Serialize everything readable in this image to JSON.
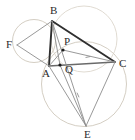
{
  "figure": {
    "width": 135,
    "height": 140,
    "background_color": "#ffffff"
  },
  "colors": {
    "heavy_stroke": "#2f2f2f",
    "medium_stroke": "#6a6a6a",
    "light_stroke": "#8d8d8d",
    "circle_stroke": "#c9c2b4",
    "circle_stroke_faint": "#d8d2c6",
    "label_color": "#2b2b2b",
    "dot_fill": "#1c1c1c"
  },
  "points": [
    {
      "name": "B",
      "label": "B",
      "x": 52,
      "y": 21,
      "label_x": 50,
      "label_y": 14,
      "dot": false
    },
    {
      "name": "F",
      "label": "F",
      "x": 17,
      "y": 45,
      "label_x": 6,
      "label_y": 48,
      "dot": false
    },
    {
      "name": "A",
      "label": "A",
      "x": 49,
      "y": 66,
      "label_x": 42,
      "label_y": 77,
      "dot": false
    },
    {
      "name": "C",
      "label": "C",
      "x": 115,
      "y": 62,
      "label_x": 119,
      "label_y": 67,
      "dot": false
    },
    {
      "name": "P",
      "label": "P",
      "x": 63,
      "y": 50,
      "label_x": 64,
      "label_y": 45,
      "dot": true
    },
    {
      "name": "Q",
      "label": "Q",
      "x": 60,
      "y": 65,
      "label_x": 65,
      "label_y": 73,
      "dot": true
    },
    {
      "name": "E",
      "label": "E",
      "x": 86,
      "y": 126,
      "label_x": 84,
      "label_y": 138,
      "dot": false
    }
  ],
  "circles": [
    {
      "name": "circumcircle-ABF",
      "cx": 34,
      "cy": 41,
      "r": 21.5,
      "stroke": "#c9c2b4",
      "width": 0.8
    },
    {
      "name": "circumcircle-ACE",
      "cx": 84,
      "cy": 84,
      "r": 42.5,
      "stroke": "#c9c2b4",
      "width": 0.8
    },
    {
      "name": "circumcircle-BPC",
      "cx": 84,
      "cy": 39,
      "r": 33.0,
      "stroke": "#d8d2c6",
      "width": 0.8
    }
  ],
  "segments": [
    {
      "name": "segment-BC",
      "from": "B",
      "to": "C",
      "stroke": "#2f2f2f",
      "width": 1.9
    },
    {
      "name": "segment-BA",
      "from": "B",
      "to": "A",
      "stroke": "#2f2f2f",
      "width": 1.9
    },
    {
      "name": "segment-AC",
      "from": "A",
      "to": "C",
      "stroke": "#6a6a6a",
      "width": 1.5
    },
    {
      "name": "segment-FB",
      "from": "F",
      "to": "B",
      "stroke": "#8d8d8d",
      "width": 0.9
    },
    {
      "name": "segment-FA",
      "from": "F",
      "to": "A",
      "stroke": "#8d8d8d",
      "width": 0.9
    },
    {
      "name": "segment-AP",
      "from": "A",
      "to": "P",
      "stroke": "#8d8d8d",
      "width": 0.9
    },
    {
      "name": "segment-PC",
      "from": "P",
      "to": "C",
      "stroke": "#8d8d8d",
      "width": 0.9
    },
    {
      "name": "segment-BQ",
      "from": "B",
      "to": "Q",
      "stroke": "#8d8d8d",
      "width": 0.9
    },
    {
      "name": "segment-BE",
      "from": "B",
      "to": "E",
      "stroke": "#8d8d8d",
      "width": 0.9
    },
    {
      "name": "segment-AE",
      "from": "A",
      "to": "E",
      "stroke": "#8d8d8d",
      "width": 0.9
    },
    {
      "name": "segment-QE",
      "from": "Q",
      "to": "E",
      "stroke": "#8d8d8d",
      "width": 0.9
    },
    {
      "name": "segment-CE",
      "from": "C",
      "to": "E",
      "stroke": "#8d8d8d",
      "width": 0.9
    }
  ],
  "tick_marks": [
    {
      "name": "tick-on-PC",
      "x": 88,
      "y": 57,
      "angle": -12,
      "length": 5
    },
    {
      "name": "tick-on-QE",
      "x": 78,
      "y": 95,
      "angle": 66,
      "length": 5
    }
  ],
  "arrow_markers": [
    {
      "name": "arrowhead-F",
      "x": 17,
      "y": 45,
      "angle": 180
    },
    {
      "name": "arrowhead-C",
      "x": 115,
      "y": 62,
      "angle": 5
    }
  ]
}
